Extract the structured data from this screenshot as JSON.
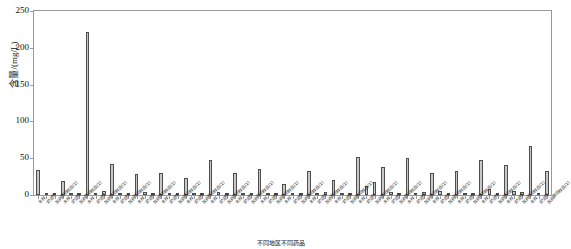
{
  "chart_data": {
    "type": "bar",
    "title": "",
    "subtitle": "",
    "xlabel": "不同地区不同药品",
    "ylabel": "含量/(mg/L)",
    "ylim": [
      0,
      250
    ],
    "yticks": [
      0,
      50,
      100,
      150,
      200,
      250
    ],
    "ytick_labels": [
      "0",
      "50",
      "100",
      "150",
      "200",
      "250"
    ],
    "grid": false,
    "legend": null,
    "legend_position": "none",
    "bar_color": "#c8c8c8",
    "bar_edge_color": "#4d4d4d",
    "axis_color": "#9a9a9a",
    "n_bars": 63,
    "max_value": 222,
    "categories": [
      "水样",
      "淤泥样",
      "加药前后样品(1)",
      "水样",
      "淤泥样",
      "加药前后样品(1)",
      "水样",
      "淤泥样",
      "加药前后样品(1)",
      "水样",
      "淤泥样",
      "加药前后样品(1)",
      "水样",
      "淤泥样",
      "加药前后样品(1)",
      "水样",
      "淤泥样",
      "加药前后样品(1)",
      "水样",
      "淤泥样",
      "加药前后样品(1)",
      "水样",
      "淤泥样",
      "加药前后样品(1)",
      "水样",
      "淤泥样",
      "加药前后样品(1)",
      "水样",
      "淤泥样",
      "加药前后样品(1)",
      "水样",
      "淤泥样",
      "加药前后样品(1)",
      "水样",
      "淤泥样",
      "加药前后样品(1)",
      "水样",
      "淤泥样",
      "加药前后样品(1)",
      "水样",
      "淤泥样",
      "加药前后样品(1)",
      "水样",
      "淤泥样",
      "加药前后样品(1)",
      "水样",
      "淤泥样",
      "加药前后样品(1)",
      "水样",
      "淤泥样",
      "加药前后样品(1)",
      "水样",
      "淤泥样",
      "加药前后样品(1)",
      "水样",
      "淤泥样",
      "加药前后样品(1)",
      "水样",
      "淤泥样",
      "加药前后样品(1)",
      "水样",
      "淤泥样",
      "加药前后样品(1)"
    ],
    "values": [
      34,
      2,
      2,
      19,
      2,
      2,
      222,
      3,
      5,
      42,
      3,
      2,
      28,
      4,
      2,
      30,
      3,
      3,
      23,
      3,
      2,
      48,
      4,
      3,
      30,
      2,
      2,
      36,
      3,
      3,
      15,
      2,
      2,
      32,
      3,
      4,
      21,
      3,
      2,
      52,
      12,
      18,
      38,
      4,
      3,
      50,
      3,
      4,
      30,
      5,
      2,
      33,
      2,
      3,
      48,
      8,
      3,
      41,
      5,
      4,
      67,
      3,
      33
    ]
  }
}
